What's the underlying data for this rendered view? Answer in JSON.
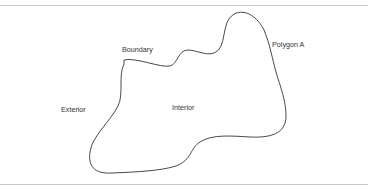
{
  "diagram": {
    "title": "Polygon A",
    "labels": {
      "boundary": "Boundary",
      "polygon": "Polygon A",
      "exterior": "Exterior",
      "interior": "Interior"
    },
    "colors": {
      "outline": "#333333",
      "rule": "#c8c8c8",
      "text": "#333333",
      "background": "#ffffff"
    }
  }
}
